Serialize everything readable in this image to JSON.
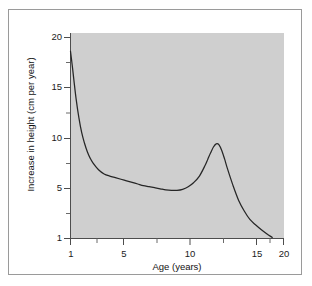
{
  "figure": {
    "caption_bleed": "",
    "panel_color": "#cfcfcf",
    "frame_color": "#9a9a9a",
    "curve_color": "#262626"
  },
  "chart_data": {
    "type": "line",
    "title": "",
    "xlabel": "Age (years)",
    "ylabel": "Increase in height (cm per year)",
    "xlim": [
      1,
      21
    ],
    "ylim": [
      1,
      21
    ],
    "xticks": [
      1,
      5,
      10,
      15,
      20
    ],
    "xtick_labels": [
      "1",
      "5",
      "10",
      "15",
      "20"
    ],
    "xminor_ticks": [
      3,
      7.5,
      12.5,
      17.5
    ],
    "yticks": [
      1,
      5,
      10,
      15,
      20
    ],
    "ytick_labels": [
      "1",
      "5",
      "10",
      "15",
      "20"
    ],
    "yminor_ticks": [
      3,
      7.5,
      12.5,
      17.5
    ],
    "grid": false,
    "legend": null,
    "series": [
      {
        "name": "Height velocity",
        "x": [
          1.0,
          1.15,
          1.3,
          1.5,
          1.75,
          2.0,
          2.25,
          2.5,
          2.75,
          3.0,
          3.5,
          4.0,
          4.5,
          5.0,
          5.5,
          6.0,
          6.5,
          7.0,
          7.5,
          8.0,
          8.5,
          9.0,
          9.5,
          10.0,
          10.5,
          11.0,
          11.5,
          12.0,
          12.5,
          13.0,
          13.25,
          13.5,
          13.75,
          14.0,
          14.25,
          14.5,
          14.75,
          15.0,
          15.5,
          16.0,
          16.5,
          17.0,
          17.5,
          18.0,
          18.5,
          19.0
        ],
        "y": [
          18.7,
          17.4,
          16.0,
          14.2,
          12.4,
          11.0,
          10.0,
          9.2,
          8.6,
          8.15,
          7.5,
          7.1,
          6.9,
          6.75,
          6.6,
          6.45,
          6.3,
          6.15,
          6.0,
          5.9,
          5.8,
          5.7,
          5.6,
          5.55,
          5.55,
          5.65,
          5.9,
          6.3,
          6.9,
          7.9,
          8.5,
          9.1,
          9.65,
          9.95,
          9.85,
          9.3,
          8.5,
          7.6,
          6.0,
          4.6,
          3.6,
          2.8,
          2.3,
          1.85,
          1.45,
          1.1
        ]
      }
    ]
  }
}
